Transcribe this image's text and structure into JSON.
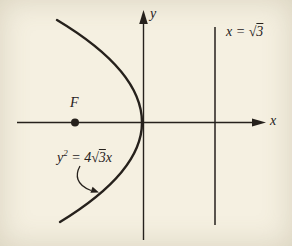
{
  "colors": {
    "ink": "#26211c",
    "paper": "#f5f0e1"
  },
  "axes": {
    "x_label": "x",
    "y_label": "y"
  },
  "focus": {
    "label": "F"
  },
  "directrix_label": {
    "pre": "x = √",
    "radicand": "3"
  },
  "equation_label": {
    "lhs": "y",
    "sup": "2",
    "mid": " = 4√",
    "radicand": "3",
    "suffix": "x"
  }
}
